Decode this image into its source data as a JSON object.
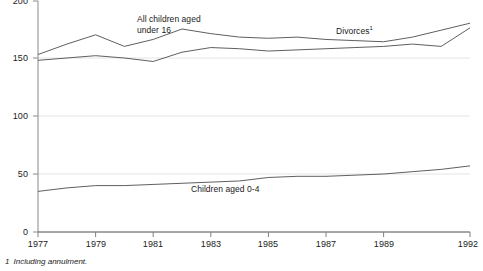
{
  "chart_data": {
    "type": "line",
    "title": "",
    "subtitle": "",
    "xlabel": "",
    "ylabel": "",
    "unit_note": "Thousands",
    "x": [
      1977,
      1978,
      1979,
      1980,
      1981,
      1982,
      1983,
      1984,
      1985,
      1986,
      1987,
      1988,
      1989,
      1990,
      1991,
      1992
    ],
    "xlim": [
      1977,
      1992
    ],
    "ylim": [
      0,
      200
    ],
    "x_ticks": [
      "1977",
      "1979",
      "1981",
      "1983",
      "1985",
      "1987",
      "1989",
      "1992"
    ],
    "x_tick_values": [
      1977,
      1979,
      1981,
      1983,
      1985,
      1987,
      1989,
      1992
    ],
    "y_ticks": [
      "0",
      "50",
      "100",
      "150",
      "200"
    ],
    "y_tick_values": [
      0,
      50,
      100,
      150,
      200
    ],
    "grid": true,
    "grid_values": [
      50,
      100,
      150
    ],
    "legend_position": "inline-annotations",
    "series": [
      {
        "name": "Divorces",
        "footnote_marker": "1",
        "label_text": "Divorces",
        "color": "#4d4d4d",
        "values": [
          153,
          162,
          170,
          160,
          166,
          175,
          171,
          168,
          167,
          168,
          166,
          165,
          164,
          168,
          174,
          180
        ]
      },
      {
        "name": "All children aged under 16",
        "label_text": "All children aged\nunder 16",
        "color": "#4d4d4d",
        "values": [
          148,
          150,
          152,
          150,
          147,
          155,
          159,
          158,
          156,
          157,
          158,
          159,
          160,
          162,
          160,
          176
        ]
      },
      {
        "name": "Children aged 0-4",
        "label_text": "Children aged 0-4",
        "color": "#4d4d4d",
        "values": [
          35,
          38,
          40,
          40,
          41,
          42,
          43,
          44,
          47,
          48,
          48,
          49,
          50,
          52,
          54,
          57
        ]
      }
    ],
    "annotations": [
      {
        "text": "All children aged",
        "x": 1981.6,
        "y": 186
      },
      {
        "text": "under 16",
        "x": 1981.6,
        "y": 178
      },
      {
        "text": "Divorces",
        "x": 1987.2,
        "y": 178
      },
      {
        "text": "Children aged 0-4",
        "x": 1983.3,
        "y": 36
      }
    ]
  },
  "footnote": {
    "marker": "1",
    "text": "Including annulment."
  },
  "axis": {
    "y_labels": [
      "200",
      "150",
      "100",
      "50",
      "0"
    ],
    "x_labels": [
      "1977",
      "1979",
      "1981",
      "1983",
      "1985",
      "1987",
      "1989",
      "1992"
    ]
  },
  "labels": {
    "all_children": {
      "line1": "All children aged",
      "line2": "under 16"
    },
    "divorces": "Divorces",
    "divorces_marker": "1",
    "children_0_4": "Children aged 0-4"
  },
  "colors": {
    "line": "#4d4d4d",
    "axis": "#808080",
    "grid": "#e2e2e2",
    "text": "#1a1a1a",
    "background": "#ffffff"
  }
}
